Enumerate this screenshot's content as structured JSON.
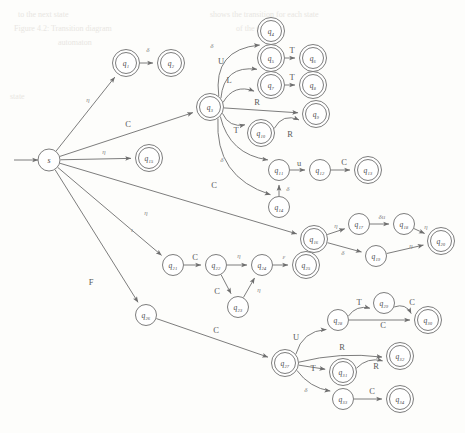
{
  "diagram": {
    "type": "state-machine",
    "width": 465,
    "height": 433,
    "colors": {
      "stroke": "#6e6e6e",
      "node_fill": "#ffffff",
      "label": "#4a4a4a",
      "edge_label": "#5a5a5a",
      "background": "#fdfdfb",
      "ghost_text": "#e8e6e2"
    },
    "start_arrow": {
      "label": "",
      "from_x": 14,
      "to_x": 38,
      "y": 160
    },
    "nodes": [
      {
        "id": "s",
        "label": "s",
        "x": 49,
        "y": 160,
        "r": 11,
        "accepting": false
      },
      {
        "id": "q1",
        "label": "q₁",
        "x": 126,
        "y": 63,
        "r": 10.5,
        "accepting": true
      },
      {
        "id": "q2",
        "label": "q₂",
        "x": 171,
        "y": 63,
        "r": 10.5,
        "accepting": true
      },
      {
        "id": "q3",
        "label": "q₃",
        "x": 210,
        "y": 107,
        "r": 10.5,
        "accepting": true
      },
      {
        "id": "q4",
        "label": "q₄",
        "x": 271,
        "y": 31,
        "r": 10.5,
        "accepting": true
      },
      {
        "id": "q5",
        "label": "q₅",
        "x": 271,
        "y": 58,
        "r": 10.5,
        "accepting": true
      },
      {
        "id": "q6",
        "label": "q₆",
        "x": 313,
        "y": 58,
        "r": 10.5,
        "accepting": true
      },
      {
        "id": "q7",
        "label": "q₇",
        "x": 271,
        "y": 85,
        "r": 10.5,
        "accepting": true
      },
      {
        "id": "q8",
        "label": "q₈",
        "x": 313,
        "y": 85,
        "r": 10.5,
        "accepting": true
      },
      {
        "id": "q9",
        "label": "q₉",
        "x": 316,
        "y": 114,
        "r": 10.5,
        "accepting": true
      },
      {
        "id": "q10",
        "label": "q₁₀",
        "x": 261,
        "y": 133,
        "r": 10.5,
        "accepting": true
      },
      {
        "id": "q11",
        "label": "q₁₁",
        "x": 279,
        "y": 170,
        "r": 10.5,
        "accepting": false
      },
      {
        "id": "q12",
        "label": "q₁₂",
        "x": 320,
        "y": 170,
        "r": 10.5,
        "accepting": false
      },
      {
        "id": "q13",
        "label": "q₁₃",
        "x": 368,
        "y": 170,
        "r": 10.5,
        "accepting": true
      },
      {
        "id": "q14",
        "label": "q₁₄",
        "x": 279,
        "y": 207,
        "r": 10.5,
        "accepting": false
      },
      {
        "id": "q15",
        "label": "q₁₅",
        "x": 149,
        "y": 158,
        "r": 10.5,
        "accepting": true
      },
      {
        "id": "q16",
        "label": "q₁₆",
        "x": 314,
        "y": 239,
        "r": 10.5,
        "accepting": true
      },
      {
        "id": "q17",
        "label": "q₁₇",
        "x": 359,
        "y": 224,
        "r": 10.5,
        "accepting": false
      },
      {
        "id": "q18",
        "label": "q₁₈",
        "x": 404,
        "y": 224,
        "r": 10.5,
        "accepting": false
      },
      {
        "id": "q19",
        "label": "q₁₉",
        "x": 376,
        "y": 256,
        "r": 10.5,
        "accepting": false
      },
      {
        "id": "q20",
        "label": "q₂₀",
        "x": 441,
        "y": 241,
        "r": 10.5,
        "accepting": true
      },
      {
        "id": "q21",
        "label": "q₂₁",
        "x": 173,
        "y": 265,
        "r": 10.5,
        "accepting": false
      },
      {
        "id": "q22",
        "label": "q₂₂",
        "x": 216,
        "y": 265,
        "r": 10.5,
        "accepting": false
      },
      {
        "id": "q23",
        "label": "q₂₃",
        "x": 238,
        "y": 307,
        "r": 10.5,
        "accepting": false
      },
      {
        "id": "q24",
        "label": "q₂₄",
        "x": 262,
        "y": 265,
        "r": 10.5,
        "accepting": false
      },
      {
        "id": "q25",
        "label": "q₂₅",
        "x": 306,
        "y": 265,
        "r": 10.5,
        "accepting": true
      },
      {
        "id": "q26",
        "label": "q₂₆",
        "x": 146,
        "y": 315,
        "r": 10.5,
        "accepting": false
      },
      {
        "id": "q27",
        "label": "q₂₇",
        "x": 285,
        "y": 363,
        "r": 10.5,
        "accepting": true
      },
      {
        "id": "q28",
        "label": "q₂₈",
        "x": 338,
        "y": 320,
        "r": 10.5,
        "accepting": false
      },
      {
        "id": "q29",
        "label": "q₂₉",
        "x": 384,
        "y": 303,
        "r": 10.5,
        "accepting": false
      },
      {
        "id": "q30",
        "label": "q₃₀",
        "x": 428,
        "y": 320,
        "r": 10.5,
        "accepting": true
      },
      {
        "id": "q31",
        "label": "q₃₁",
        "x": 343,
        "y": 372,
        "r": 10.5,
        "accepting": true
      },
      {
        "id": "q32",
        "label": "q₃₂",
        "x": 400,
        "y": 356,
        "r": 10.5,
        "accepting": true
      },
      {
        "id": "q33",
        "label": "q₃₃",
        "x": 343,
        "y": 399,
        "r": 10.5,
        "accepting": false
      },
      {
        "id": "q34",
        "label": "q₃₄",
        "x": 400,
        "y": 399,
        "r": 10.5,
        "accepting": true
      }
    ],
    "edges": [
      {
        "from": "s",
        "to": "q1",
        "label": "η",
        "lx": 88,
        "ly": 100,
        "curve": 0
      },
      {
        "from": "q1",
        "to": "q2",
        "label": "δ",
        "lx": 148,
        "ly": 50,
        "curve": 0
      },
      {
        "from": "s",
        "to": "q3",
        "label": "C",
        "lx": 128,
        "ly": 124,
        "curve": 0
      },
      {
        "from": "s",
        "to": "q15",
        "label": "η",
        "lx": 104,
        "ly": 152,
        "curve": 0
      },
      {
        "from": "s",
        "to": "q16",
        "label": "η",
        "lx": 146,
        "ly": 213,
        "curve": 0
      },
      {
        "from": "s",
        "to": "q21",
        "label": "ι",
        "lx": 132,
        "ly": 230,
        "curve": 0
      },
      {
        "from": "s",
        "to": "q26",
        "label": "F",
        "lx": 91,
        "ly": 282,
        "curve": 0
      },
      {
        "from": "q3",
        "to": "q4",
        "label": "δ",
        "lx": 212,
        "ly": 46,
        "curve": -34
      },
      {
        "from": "q3",
        "to": "q5",
        "label": "U",
        "lx": 221,
        "ly": 61,
        "curve": -24
      },
      {
        "from": "q3",
        "to": "q7",
        "label": "L",
        "lx": 229,
        "ly": 80,
        "curve": -14
      },
      {
        "from": "q5",
        "to": "q6",
        "label": "T",
        "lx": 292,
        "ly": 50,
        "curve": 0
      },
      {
        "from": "q7",
        "to": "q8",
        "label": "T",
        "lx": 292,
        "ly": 77,
        "curve": 0
      },
      {
        "from": "q3",
        "to": "q9",
        "label": "R",
        "lx": 257,
        "ly": 102,
        "curve": 0
      },
      {
        "from": "q3",
        "to": "q10",
        "label": "T",
        "lx": 236,
        "ly": 130,
        "curve": 10
      },
      {
        "from": "q10",
        "to": "q9",
        "label": "R",
        "lx": 290,
        "ly": 134,
        "curve": -12
      },
      {
        "from": "q3",
        "to": "q11",
        "label": "δ",
        "lx": 222,
        "ly": 160,
        "curve": 22
      },
      {
        "from": "q11",
        "to": "q12",
        "label": "u",
        "lx": 299,
        "ly": 163,
        "curve": 0
      },
      {
        "from": "q12",
        "to": "q13",
        "label": "C",
        "lx": 344,
        "ly": 162,
        "curve": 0
      },
      {
        "from": "q3",
        "to": "q14",
        "label": "C",
        "lx": 214,
        "ly": 185,
        "curve": 36
      },
      {
        "from": "q14",
        "to": "q11",
        "label": "δ",
        "lx": 288,
        "ly": 189,
        "curve": 0
      },
      {
        "from": "q16",
        "to": "q17",
        "label": "η",
        "lx": 336,
        "ly": 226,
        "curve": 0
      },
      {
        "from": "q17",
        "to": "q18",
        "label": "δu",
        "lx": 382,
        "ly": 217,
        "curve": 0
      },
      {
        "from": "q18",
        "to": "q20",
        "label": "η",
        "lx": 426,
        "ly": 227,
        "curve": 0
      },
      {
        "from": "q16",
        "to": "q19",
        "label": "δ",
        "lx": 343,
        "ly": 253,
        "curve": 0
      },
      {
        "from": "q19",
        "to": "q20",
        "label": "η",
        "lx": 411,
        "ly": 246,
        "curve": 0
      },
      {
        "from": "q21",
        "to": "q22",
        "label": "C",
        "lx": 195,
        "ly": 257,
        "curve": 0
      },
      {
        "from": "q22",
        "to": "q24",
        "label": "η",
        "lx": 239,
        "ly": 256,
        "curve": 0
      },
      {
        "from": "q22",
        "to": "q23",
        "label": "C",
        "lx": 217,
        "ly": 291,
        "curve": 0
      },
      {
        "from": "q23",
        "to": "q24",
        "label": "η",
        "lx": 259,
        "ly": 290,
        "curve": 0
      },
      {
        "from": "q24",
        "to": "q25",
        "label": "ε",
        "lx": 284,
        "ly": 257,
        "curve": 0
      },
      {
        "from": "q26",
        "to": "q27",
        "label": "C",
        "lx": 216,
        "ly": 330,
        "curve": 0
      },
      {
        "from": "q27",
        "to": "q28",
        "label": "U",
        "lx": 296,
        "ly": 337,
        "curve": -14
      },
      {
        "from": "q28",
        "to": "q29",
        "label": "T",
        "lx": 359,
        "ly": 302,
        "curve": -8
      },
      {
        "from": "q29",
        "to": "q30",
        "label": "C",
        "lx": 412,
        "ly": 302,
        "curve": -8
      },
      {
        "from": "q28",
        "to": "q30",
        "label": "C",
        "lx": 383,
        "ly": 325,
        "curve": 0
      },
      {
        "from": "q27",
        "to": "q32",
        "label": "R",
        "lx": 342,
        "ly": 347,
        "curve": -8
      },
      {
        "from": "q27",
        "to": "q31",
        "label": "T",
        "lx": 313,
        "ly": 368,
        "curve": 0
      },
      {
        "from": "q31",
        "to": "q32",
        "label": "R",
        "lx": 376,
        "ly": 366,
        "curve": -8
      },
      {
        "from": "q27",
        "to": "q33",
        "label": "δ",
        "lx": 306,
        "ly": 390,
        "curve": 8
      },
      {
        "from": "q33",
        "to": "q34",
        "label": "C",
        "lx": 372,
        "ly": 391,
        "curve": 0
      }
    ],
    "ghost_text": [
      {
        "text": "to the next state",
        "x": 18,
        "y": 14,
        "size": 8
      },
      {
        "text": "shows the transition for each state",
        "x": 210,
        "y": 14,
        "size": 8
      },
      {
        "text": "Figure 4.2: Transition diagram",
        "x": 14,
        "y": 28,
        "size": 8
      },
      {
        "text": "of the scanner",
        "x": 236,
        "y": 28,
        "size": 8
      },
      {
        "text": "automaton",
        "x": 58,
        "y": 42,
        "size": 8
      },
      {
        "text": "state",
        "x": 10,
        "y": 96,
        "size": 8
      }
    ]
  }
}
